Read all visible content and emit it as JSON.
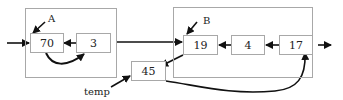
{
  "diagram": {
    "groups": [
      {
        "id": "A",
        "label": "A",
        "nodes": [
          "70",
          "3"
        ]
      },
      {
        "id": "B",
        "label": "B",
        "nodes": [
          "19",
          "4",
          "17"
        ]
      }
    ],
    "nodes": {
      "n70": "70",
      "n3": "3",
      "n19": "19",
      "n4": "4",
      "n17": "17",
      "n45": "45"
    },
    "labels": {
      "A": "A",
      "B": "B",
      "temp": "temp"
    },
    "edges": [
      {
        "from": "input",
        "to": "70"
      },
      {
        "from": "3",
        "to": "70"
      },
      {
        "from": "70",
        "to": "3",
        "curved": true
      },
      {
        "from": "boxA",
        "to": "19"
      },
      {
        "from": "4",
        "to": "19"
      },
      {
        "from": "17",
        "to": "4"
      },
      {
        "from": "19",
        "to": "45"
      },
      {
        "from": "45",
        "to": "17",
        "curved": true
      },
      {
        "from": "17",
        "to": "output"
      },
      {
        "from": "temp",
        "to": "45"
      },
      {
        "from": "A",
        "to": "70"
      },
      {
        "from": "B",
        "to": "19"
      }
    ],
    "colors": {
      "stroke": "#111111",
      "box": "#a8a8a8"
    }
  }
}
